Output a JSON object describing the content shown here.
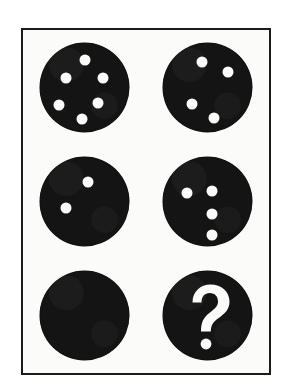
{
  "puzzle": {
    "title": "Dotted Disc Matrix Puzzle",
    "card_background": "#fbfbfa",
    "page_background": "#ffffff",
    "frame_color": "#1b1b1b",
    "disc_color": "#141414",
    "dot_color": "#fbfbfa",
    "grid": {
      "columns": 2,
      "rows": 3
    },
    "frame": {
      "x": 21,
      "y": 28,
      "width": 250,
      "height": 347,
      "border_width": 2
    },
    "disc_diameter": 89,
    "dot_diameter": 11,
    "missing_marker": "?",
    "cells": [
      {
        "index": 1,
        "position": "top-left",
        "name": "disc-six-dots",
        "dot_count": 6,
        "arrangement": "hexagonal-ring",
        "dots": [
          {
            "cx": 50,
            "cy": 20
          },
          {
            "cx": 29,
            "cy": 40
          },
          {
            "cx": 71,
            "cy": 40
          },
          {
            "cx": 21,
            "cy": 70
          },
          {
            "cx": 65,
            "cy": 68
          },
          {
            "cx": 47,
            "cy": 86
          }
        ]
      },
      {
        "index": 2,
        "position": "top-right",
        "name": "disc-four-dots-arc",
        "dot_count": 4,
        "arrangement": "descending-arc",
        "dots": [
          {
            "cx": 44,
            "cy": 22
          },
          {
            "cx": 73,
            "cy": 33
          },
          {
            "cx": 33,
            "cy": 69
          },
          {
            "cx": 57,
            "cy": 85
          }
        ]
      },
      {
        "index": 3,
        "position": "middle-left",
        "name": "disc-two-dots",
        "dot_count": 2,
        "arrangement": "diagonal-pair",
        "dots": [
          {
            "cx": 54,
            "cy": 28
          },
          {
            "cx": 29,
            "cy": 57
          }
        ]
      },
      {
        "index": 4,
        "position": "middle-right",
        "name": "disc-four-dots-column",
        "dot_count": 4,
        "arrangement": "column-plus-left",
        "dots": [
          {
            "cx": 27,
            "cy": 41
          },
          {
            "cx": 55,
            "cy": 38
          },
          {
            "cx": 55,
            "cy": 64
          },
          {
            "cx": 55,
            "cy": 88
          }
        ]
      },
      {
        "index": 5,
        "position": "bottom-left",
        "name": "disc-blank",
        "dot_count": 0,
        "arrangement": "none",
        "dots": []
      },
      {
        "index": 6,
        "position": "bottom-right",
        "name": "disc-question-mark",
        "dot_count": 0,
        "arrangement": "question-mark",
        "dots": [],
        "marker": "?"
      }
    ]
  }
}
